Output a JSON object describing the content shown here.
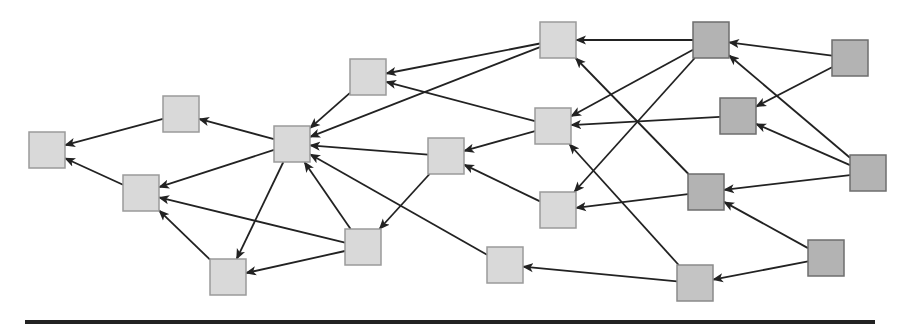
{
  "diagram": {
    "type": "directed-graph",
    "node_size": 36,
    "colors": {
      "light_fill": "#d9d9d9",
      "light_stroke": "#9a9a9a",
      "dark_fill": "#b3b3b3",
      "dark_stroke": "#6e6e6e",
      "mid_fill": "#c4c4c4",
      "edge": "#222222",
      "rule": "#222222"
    },
    "nodes": [
      {
        "id": "n1",
        "x": 29,
        "y": 132,
        "tone": "light"
      },
      {
        "id": "n2",
        "x": 163,
        "y": 96,
        "tone": "light"
      },
      {
        "id": "n3",
        "x": 123,
        "y": 175,
        "tone": "light"
      },
      {
        "id": "n4",
        "x": 210,
        "y": 259,
        "tone": "light"
      },
      {
        "id": "n5",
        "x": 274,
        "y": 126,
        "tone": "light"
      },
      {
        "id": "n6",
        "x": 350,
        "y": 59,
        "tone": "light"
      },
      {
        "id": "n7",
        "x": 345,
        "y": 229,
        "tone": "light"
      },
      {
        "id": "n8",
        "x": 428,
        "y": 138,
        "tone": "light"
      },
      {
        "id": "n9",
        "x": 540,
        "y": 22,
        "tone": "light"
      },
      {
        "id": "n10",
        "x": 535,
        "y": 108,
        "tone": "light"
      },
      {
        "id": "n11",
        "x": 540,
        "y": 192,
        "tone": "light"
      },
      {
        "id": "n12",
        "x": 487,
        "y": 247,
        "tone": "light"
      },
      {
        "id": "n13",
        "x": 693,
        "y": 22,
        "tone": "dark"
      },
      {
        "id": "n14",
        "x": 720,
        "y": 98,
        "tone": "dark"
      },
      {
        "id": "n15",
        "x": 688,
        "y": 174,
        "tone": "dark"
      },
      {
        "id": "n16",
        "x": 677,
        "y": 265,
        "tone": "mid"
      },
      {
        "id": "n17",
        "x": 832,
        "y": 40,
        "tone": "dark"
      },
      {
        "id": "n18",
        "x": 850,
        "y": 155,
        "tone": "dark"
      },
      {
        "id": "n19",
        "x": 808,
        "y": 240,
        "tone": "dark"
      }
    ],
    "edges": [
      {
        "from": "n2",
        "to": "n1"
      },
      {
        "from": "n3",
        "to": "n1"
      },
      {
        "from": "n5",
        "to": "n2"
      },
      {
        "from": "n5",
        "to": "n3"
      },
      {
        "from": "n5",
        "to": "n4"
      },
      {
        "from": "n7",
        "to": "n3"
      },
      {
        "from": "n4",
        "to": "n3"
      },
      {
        "from": "n7",
        "to": "n4"
      },
      {
        "from": "n6",
        "to": "n5"
      },
      {
        "from": "n9",
        "to": "n5"
      },
      {
        "from": "n8",
        "to": "n5"
      },
      {
        "from": "n7",
        "to": "n5"
      },
      {
        "from": "n12",
        "to": "n5"
      },
      {
        "from": "n9",
        "to": "n6"
      },
      {
        "from": "n10",
        "to": "n6"
      },
      {
        "from": "n8",
        "to": "n7"
      },
      {
        "from": "n10",
        "to": "n8"
      },
      {
        "from": "n11",
        "to": "n8"
      },
      {
        "from": "n13",
        "to": "n9"
      },
      {
        "from": "n15",
        "to": "n9"
      },
      {
        "from": "n13",
        "to": "n10"
      },
      {
        "from": "n14",
        "to": "n10"
      },
      {
        "from": "n16",
        "to": "n10"
      },
      {
        "from": "n13",
        "to": "n11"
      },
      {
        "from": "n15",
        "to": "n11"
      },
      {
        "from": "n16",
        "to": "n12"
      },
      {
        "from": "n17",
        "to": "n13"
      },
      {
        "from": "n18",
        "to": "n13"
      },
      {
        "from": "n17",
        "to": "n14"
      },
      {
        "from": "n18",
        "to": "n14"
      },
      {
        "from": "n18",
        "to": "n15"
      },
      {
        "from": "n19",
        "to": "n15"
      },
      {
        "from": "n19",
        "to": "n16"
      }
    ],
    "rule": {
      "x": 25,
      "y": 320,
      "width": 850,
      "height": 4
    }
  }
}
